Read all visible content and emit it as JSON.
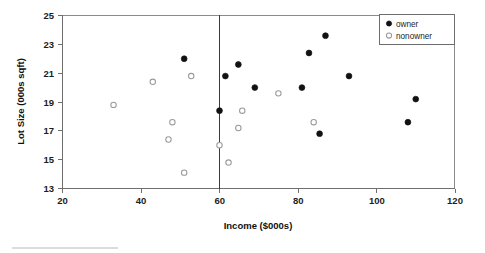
{
  "chart_data": {
    "type": "scatter",
    "title": "",
    "xlabel": "Income ($000s)",
    "ylabel": "Lot Size (000s sqft)",
    "xlim": [
      20,
      120
    ],
    "ylim": [
      13,
      25
    ],
    "xticks": [
      20,
      40,
      60,
      80,
      100,
      120
    ],
    "yticks": [
      13,
      15,
      17,
      19,
      21,
      23,
      25
    ],
    "grid": false,
    "legend_position": "top-right",
    "legend": [
      "owner",
      "nonowner"
    ],
    "annotations": [
      {
        "name": "vertical-threshold-line",
        "type": "vline",
        "x": 60
      }
    ],
    "series": [
      {
        "name": "owner",
        "marker": "filled-circle",
        "color": "#121212",
        "points": [
          {
            "x": 51.0,
            "y": 22.0
          },
          {
            "x": 60.0,
            "y": 18.4
          },
          {
            "x": 61.5,
            "y": 20.8
          },
          {
            "x": 64.8,
            "y": 21.6
          },
          {
            "x": 69.0,
            "y": 20.0
          },
          {
            "x": 81.0,
            "y": 20.0
          },
          {
            "x": 82.8,
            "y": 22.4
          },
          {
            "x": 85.5,
            "y": 16.8
          },
          {
            "x": 87.0,
            "y": 23.6
          },
          {
            "x": 93.0,
            "y": 20.8
          },
          {
            "x": 108.0,
            "y": 17.6
          },
          {
            "x": 110.0,
            "y": 19.2
          }
        ]
      },
      {
        "name": "nonowner",
        "marker": "open-circle",
        "color": "#9a9a9a",
        "points": [
          {
            "x": 33.0,
            "y": 18.8
          },
          {
            "x": 43.0,
            "y": 20.4
          },
          {
            "x": 47.0,
            "y": 16.4
          },
          {
            "x": 48.0,
            "y": 17.6
          },
          {
            "x": 51.0,
            "y": 14.1
          },
          {
            "x": 52.8,
            "y": 20.8
          },
          {
            "x": 60.0,
            "y": 16.0
          },
          {
            "x": 62.3,
            "y": 14.8
          },
          {
            "x": 64.8,
            "y": 17.2
          },
          {
            "x": 65.8,
            "y": 18.4
          },
          {
            "x": 75.0,
            "y": 19.6
          },
          {
            "x": 84.0,
            "y": 17.6
          }
        ]
      }
    ]
  },
  "axes": {
    "x_title": "Income ($000s)",
    "y_title": "Lot Size (000s sqft)",
    "x_tick_labels": [
      "20",
      "40",
      "60",
      "80",
      "100",
      "120"
    ],
    "y_tick_labels": [
      "13",
      "15",
      "17",
      "19",
      "21",
      "23",
      "25"
    ]
  },
  "legend": {
    "items": [
      {
        "label": "owner",
        "marker": "filled-circle"
      },
      {
        "label": "nonowner",
        "marker": "open-circle"
      }
    ]
  },
  "colors": {
    "owner_marker": "#121212",
    "nonowner_marker": "#9a9a9a",
    "axis": "#6f6f6f",
    "divider": "#3a3a3a",
    "background": "#ffffff"
  }
}
